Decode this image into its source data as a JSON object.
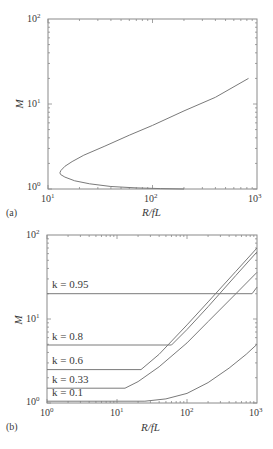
{
  "panels": {
    "a": {
      "tag": "(a)",
      "xlabel": "R/fL",
      "ylabel": "M",
      "xticks": [
        "10",
        "10",
        "10"
      ],
      "xtick_exp": [
        "1",
        "2",
        "3"
      ],
      "yticks": [
        "10",
        "10",
        "10"
      ],
      "ytick_exp": [
        "0",
        "1",
        "2"
      ]
    },
    "b": {
      "tag": "(b)",
      "xlabel": "R/fL",
      "ylabel": "M",
      "xticks": [
        "10",
        "10",
        "10",
        "10"
      ],
      "xtick_exp": [
        "0",
        "1",
        "2",
        "3"
      ],
      "yticks": [
        "10",
        "10",
        "10"
      ],
      "ytick_exp": [
        "0",
        "1",
        "2"
      ],
      "curve_labels": [
        "k = 0.95",
        "k = 0.8",
        "k = 0.6",
        "k = 0.33",
        "k = 0.1"
      ]
    }
  },
  "chart_data": [
    {
      "type": "line",
      "title": "(a)",
      "xlabel": "R/fL",
      "ylabel": "M",
      "xscale": "log",
      "yscale": "log",
      "xlim": [
        10,
        1000
      ],
      "ylim": [
        1,
        100
      ],
      "grid": false,
      "series": [
        {
          "name": "M vs R/fL",
          "x": [
            200,
            120,
            70,
            40,
            25,
            18,
            14.5,
            13.2,
            13.0,
            13.3,
            14.5,
            17,
            22,
            35,
            60,
            100,
            200,
            400,
            830
          ],
          "y": [
            1.0,
            1.01,
            1.03,
            1.07,
            1.15,
            1.25,
            1.38,
            1.48,
            1.55,
            1.65,
            1.85,
            2.1,
            2.5,
            3.2,
            4.3,
            5.6,
            8.3,
            12.0,
            20.0
          ]
        }
      ]
    },
    {
      "type": "line",
      "title": "(b)",
      "xlabel": "R/fL",
      "ylabel": "M",
      "xscale": "log",
      "yscale": "log",
      "xlim": [
        1,
        1000
      ],
      "ylim": [
        1,
        100
      ],
      "grid": false,
      "series": [
        {
          "name": "k = 0.95",
          "x": [
            1,
            850,
            1000
          ],
          "y": [
            20,
            20,
            24
          ]
        },
        {
          "name": "k = 0.8",
          "x": [
            1,
            60,
            100,
            200,
            500,
            1000
          ],
          "y": [
            4.9,
            4.9,
            7.5,
            14,
            33,
            63
          ]
        },
        {
          "name": "k = 0.6",
          "x": [
            1,
            22,
            40,
            100,
            200,
            500,
            1000
          ],
          "y": [
            2.5,
            2.5,
            3.8,
            8.5,
            16,
            37,
            70
          ]
        },
        {
          "name": "k = 0.33",
          "x": [
            1,
            13,
            20,
            40,
            100,
            200,
            500,
            1000
          ],
          "y": [
            1.5,
            1.5,
            1.8,
            2.7,
            5.2,
            9.3,
            20,
            36
          ]
        },
        {
          "name": "k = 0.1",
          "x": [
            1,
            25,
            50,
            100,
            200,
            400,
            700,
            1000
          ],
          "y": [
            1.05,
            1.05,
            1.12,
            1.3,
            1.75,
            2.6,
            3.8,
            5.0
          ]
        }
      ]
    }
  ]
}
